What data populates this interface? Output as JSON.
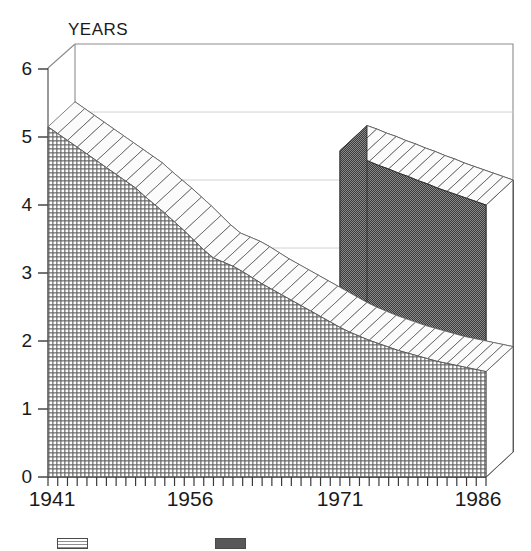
{
  "chart_data": {
    "type": "area",
    "title": "",
    "ylabel": "YEARS",
    "xlabel": "",
    "ylim": [
      0,
      6
    ],
    "xlim": [
      1941,
      1986
    ],
    "grid": true,
    "projection": "3d-ribbon",
    "legend_position": "bottom",
    "yticks": [
      0,
      1,
      2,
      3,
      4,
      5,
      6
    ],
    "ytick_labels": [
      "0",
      "1",
      "2",
      "3",
      "4",
      "5",
      "6"
    ],
    "xticks": [
      1941,
      1956,
      1971,
      1986
    ],
    "xtick_labels": [
      "1941",
      "1956",
      "1971",
      "1986"
    ],
    "x": [
      1941,
      1942,
      1943,
      1944,
      1945,
      1946,
      1947,
      1948,
      1949,
      1950,
      1951,
      1952,
      1953,
      1954,
      1955,
      1956,
      1957,
      1958,
      1959,
      1960,
      1961,
      1962,
      1963,
      1964,
      1965,
      1966,
      1967,
      1968,
      1969,
      1970,
      1971,
      1972,
      1973,
      1974,
      1975,
      1976,
      1977,
      1978,
      1979,
      1980,
      1981,
      1982,
      1983,
      1984,
      1985,
      1986
    ],
    "series": [
      {
        "name": "Series 1",
        "color": "#9a9a9a",
        "fill": "light-crosshatch",
        "values": [
          5.15,
          5.05,
          4.95,
          4.85,
          4.75,
          4.65,
          4.55,
          4.45,
          4.35,
          4.25,
          4.12,
          4.0,
          3.88,
          3.75,
          3.62,
          3.48,
          3.34,
          3.22,
          3.16,
          3.1,
          3.02,
          2.93,
          2.84,
          2.76,
          2.68,
          2.6,
          2.52,
          2.44,
          2.36,
          2.28,
          2.2,
          2.13,
          2.07,
          2.01,
          1.96,
          1.91,
          1.86,
          1.82,
          1.78,
          1.74,
          1.7,
          1.67,
          1.64,
          1.61,
          1.58,
          1.55
        ]
      },
      {
        "name": "Series 2",
        "color": "#585858",
        "fill": "dark-checker",
        "start_x": 1971,
        "values": [
          null,
          null,
          null,
          null,
          null,
          null,
          null,
          null,
          null,
          null,
          null,
          null,
          null,
          null,
          null,
          null,
          null,
          null,
          null,
          null,
          null,
          null,
          null,
          null,
          null,
          null,
          null,
          null,
          null,
          null,
          4.8,
          4.75,
          4.69,
          4.64,
          4.58,
          4.53,
          4.47,
          4.42,
          4.36,
          4.31,
          4.25,
          4.2,
          4.15,
          4.1,
          4.05,
          4.0
        ]
      }
    ]
  },
  "legend": {
    "entries": [
      {
        "label": "",
        "swatch": "light-crosshatch",
        "x": 57
      },
      {
        "label": "",
        "swatch": "dark-checker",
        "x": 215
      }
    ]
  }
}
